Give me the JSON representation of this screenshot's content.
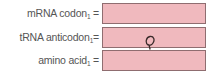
{
  "fields": [
    {
      "label": "mRNA codon",
      "subscript": "1",
      "equals": "=",
      "value": ""
    },
    {
      "label": "tRNA anticodon",
      "subscript": "1",
      "equals": "=",
      "value": ""
    },
    {
      "label": "amino acid",
      "subscript": "1",
      "equals": "=",
      "value": ""
    }
  ],
  "colors": {
    "box_fill": "#f0b9be",
    "box_border": "#8f6d70",
    "label": "#555555"
  },
  "cursor": {
    "icon": "handwritten-loop-cursor-icon"
  }
}
